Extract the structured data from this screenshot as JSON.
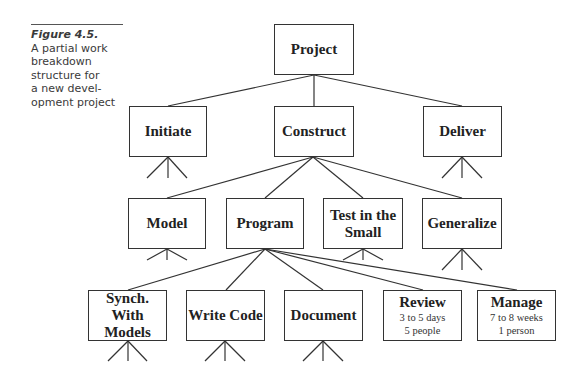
{
  "caption": {
    "figure": "Figure 4.5.",
    "description": "A partial work breakdown structure for a new development project",
    "lines": [
      "A partial work",
      "breakdown",
      "structure for",
      "a new devel-",
      "opment project"
    ]
  },
  "diagram": {
    "type": "work-breakdown-structure",
    "root": {
      "label": "Project"
    },
    "level1": [
      {
        "label": "Initiate"
      },
      {
        "label": "Construct"
      },
      {
        "label": "Deliver"
      }
    ],
    "level2": [
      {
        "label": "Model",
        "parent": "Construct"
      },
      {
        "label": "Program",
        "parent": "Construct"
      },
      {
        "label": "Test in the Small",
        "line1": "Test in the",
        "line2": "Small",
        "parent": "Construct"
      },
      {
        "label": "Generalize",
        "parent": "Construct"
      }
    ],
    "level3": [
      {
        "label": "Synch. With Models",
        "line1": "Synch. With",
        "line2": "Models",
        "parent": "Program"
      },
      {
        "label": "Write Code",
        "parent": "Program"
      },
      {
        "label": "Document",
        "parent": "Program"
      },
      {
        "label": "Review",
        "parent": "Program",
        "duration": "3 to 5 days",
        "staff": "5 people"
      },
      {
        "label": "Manage",
        "parent": "Program",
        "duration": "7 to 8 weeks",
        "staff": "1 person"
      }
    ]
  }
}
